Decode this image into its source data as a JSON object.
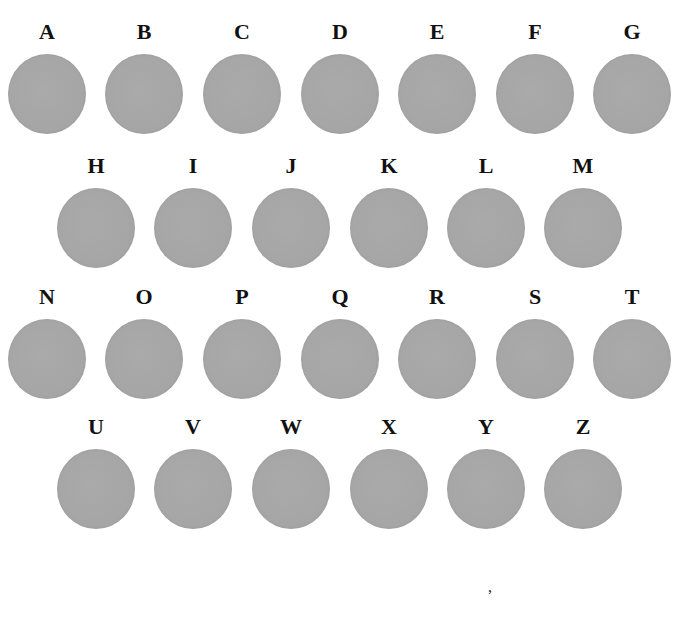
{
  "figure": {
    "disc_color": "#a8a8a8",
    "rows": [
      {
        "y": 20,
        "items": [
          {
            "letter": "A",
            "x": 7
          },
          {
            "letter": "B",
            "x": 104
          },
          {
            "letter": "C",
            "x": 202
          },
          {
            "letter": "D",
            "x": 300
          },
          {
            "letter": "E",
            "x": 397
          },
          {
            "letter": "F",
            "x": 495
          },
          {
            "letter": "G",
            "x": 592
          }
        ]
      },
      {
        "y": 154,
        "items": [
          {
            "letter": "H",
            "x": 56
          },
          {
            "letter": "I",
            "x": 153
          },
          {
            "letter": "J",
            "x": 251
          },
          {
            "letter": "K",
            "x": 349
          },
          {
            "letter": "L",
            "x": 446
          },
          {
            "letter": "M",
            "x": 543
          }
        ]
      },
      {
        "y": 285,
        "items": [
          {
            "letter": "N",
            "x": 7
          },
          {
            "letter": "O",
            "x": 104
          },
          {
            "letter": "P",
            "x": 202
          },
          {
            "letter": "Q",
            "x": 300
          },
          {
            "letter": "R",
            "x": 397
          },
          {
            "letter": "S",
            "x": 495
          },
          {
            "letter": "T",
            "x": 592
          }
        ]
      },
      {
        "y": 415,
        "items": [
          {
            "letter": "U",
            "x": 56
          },
          {
            "letter": "V",
            "x": 153
          },
          {
            "letter": "W",
            "x": 251
          },
          {
            "letter": "X",
            "x": 349
          },
          {
            "letter": "Y",
            "x": 446
          },
          {
            "letter": "Z",
            "x": 543
          }
        ]
      }
    ],
    "stray_mark": ","
  }
}
